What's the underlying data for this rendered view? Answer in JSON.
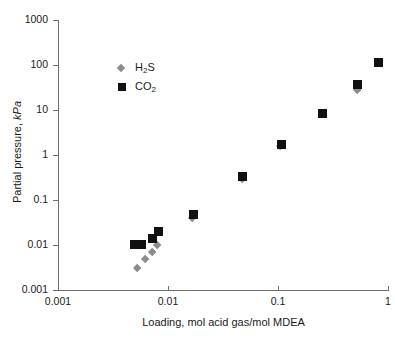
{
  "chart_data": {
    "type": "scatter",
    "title": "",
    "xlabel": "Loading, mol acid gas/mol MDEA",
    "ylabel": "Partial pressure, kPa",
    "xscale": "log",
    "yscale": "log",
    "xlim": [
      0.001,
      1
    ],
    "ylim": [
      0.001,
      1000
    ],
    "grid": false,
    "legend_position": "upper-left-inside",
    "xticks": [
      "0.001",
      "0.01",
      "0.1",
      "1"
    ],
    "xtick_values": [
      0.001,
      0.01,
      0.1,
      1
    ],
    "yticks": [
      "0.001",
      "0.01",
      "0.1",
      "1",
      "10",
      "100",
      "1000"
    ],
    "ytick_values": [
      0.001,
      0.01,
      0.1,
      1,
      10,
      100,
      1000
    ],
    "series": [
      {
        "name": "H2S",
        "label": "H",
        "label_sub": "2",
        "label_tail": "S",
        "marker": "diamond",
        "color": "#8c8c8c",
        "points": [
          {
            "x": 0.0052,
            "y": 0.003
          },
          {
            "x": 0.0062,
            "y": 0.0048
          },
          {
            "x": 0.0072,
            "y": 0.0068
          },
          {
            "x": 0.008,
            "y": 0.01
          },
          {
            "x": 0.0165,
            "y": 0.04
          },
          {
            "x": 0.047,
            "y": 0.29
          },
          {
            "x": 0.105,
            "y": 1.55
          },
          {
            "x": 0.52,
            "y": 28
          }
        ]
      },
      {
        "name": "CO2",
        "label": "CO",
        "label_sub": "2",
        "label_tail": "",
        "marker": "square",
        "color": "#111111",
        "points": [
          {
            "x": 0.005,
            "y": 0.0105
          },
          {
            "x": 0.0058,
            "y": 0.0105
          },
          {
            "x": 0.0072,
            "y": 0.014
          },
          {
            "x": 0.0082,
            "y": 0.0195
          },
          {
            "x": 0.017,
            "y": 0.047
          },
          {
            "x": 0.048,
            "y": 0.33
          },
          {
            "x": 0.108,
            "y": 1.75
          },
          {
            "x": 0.255,
            "y": 8.4
          },
          {
            "x": 0.53,
            "y": 36
          },
          {
            "x": 0.82,
            "y": 115
          }
        ]
      }
    ]
  },
  "legend": {
    "items": [
      {
        "marker": "diamond",
        "text_main": "H",
        "text_sub": "2",
        "text_tail": "S"
      },
      {
        "marker": "square",
        "text_main": "CO",
        "text_sub": "2",
        "text_tail": ""
      }
    ]
  },
  "axis_titles": {
    "y_main": "Partial pressure, ",
    "y_italic": "kPa",
    "x": "Loading, mol acid gas/mol MDEA"
  },
  "colors": {
    "h2s": "#8c8c8c",
    "co2": "#111111",
    "axis": "#6e6e6e",
    "text": "#1a1a1a",
    "background": "#ffffff"
  }
}
